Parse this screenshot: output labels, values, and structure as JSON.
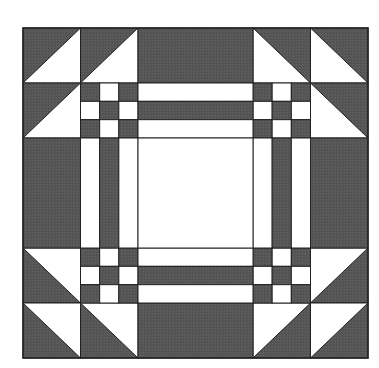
{
  "diagram": {
    "type": "quilt-block",
    "colors": {
      "dark": "#555555",
      "light": "#ffffff",
      "line": "#222222",
      "background": "#ffffff"
    },
    "grid": {
      "x": [
        23,
        80.5,
        138,
        253,
        310.5,
        368
      ],
      "y": [
        28,
        83,
        138,
        248,
        303,
        358
      ]
    }
  }
}
